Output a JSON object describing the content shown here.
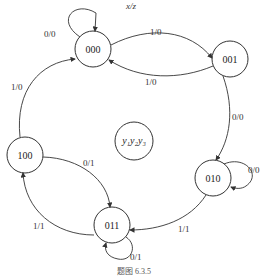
{
  "diagram": {
    "type": "state-transition",
    "io_label": "x/z",
    "state_var_label": "y₁y₂y₃",
    "caption": "题图 6.3.5",
    "states": [
      {
        "id": "000",
        "label": "000"
      },
      {
        "id": "001",
        "label": "001"
      },
      {
        "id": "010",
        "label": "010"
      },
      {
        "id": "011",
        "label": "011"
      },
      {
        "id": "100",
        "label": "100"
      }
    ],
    "transitions": [
      {
        "from": "000",
        "to": "000",
        "label": "0/0"
      },
      {
        "from": "000",
        "to": "001",
        "label": "1/0"
      },
      {
        "from": "001",
        "to": "000",
        "label": "1/0"
      },
      {
        "from": "001",
        "to": "010",
        "label": "0/0"
      },
      {
        "from": "010",
        "to": "010",
        "label": "0/0"
      },
      {
        "from": "010",
        "to": "011",
        "label": "1/1"
      },
      {
        "from": "011",
        "to": "011",
        "label": "0/1"
      },
      {
        "from": "011",
        "to": "100",
        "label": "1/1"
      },
      {
        "from": "100",
        "to": "011",
        "label": "0/1"
      },
      {
        "from": "100",
        "to": "000",
        "label": "1/0"
      }
    ]
  }
}
